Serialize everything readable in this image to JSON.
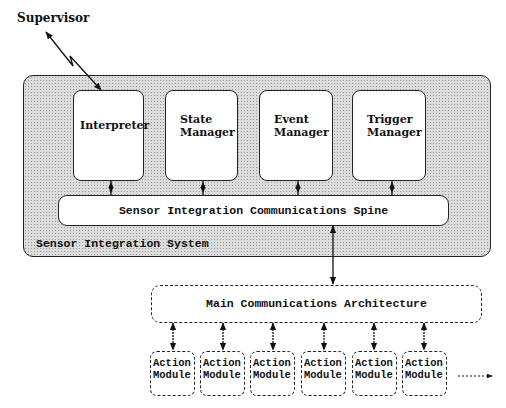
{
  "diagram": {
    "supervisor": {
      "label": "Supervisor"
    },
    "system": {
      "label": "Sensor Integration System",
      "components": [
        {
          "line1": "Interpreter",
          "line2": ""
        },
        {
          "line1": "State",
          "line2": "Manager"
        },
        {
          "line1": "Event",
          "line2": "Manager"
        },
        {
          "line1": "Trigger",
          "line2": "Manager"
        }
      ],
      "spine": {
        "label": "Sensor Integration Communications Spine"
      }
    },
    "main_architecture": {
      "label": "Main Communications Architecture"
    },
    "action_modules": [
      {
        "line1": "Action",
        "line2": "Module"
      },
      {
        "line1": "Action",
        "line2": "Module"
      },
      {
        "line1": "Action",
        "line2": "Module"
      },
      {
        "line1": "Action",
        "line2": "Module"
      },
      {
        "line1": "Action",
        "line2": "Module"
      },
      {
        "line1": "Action",
        "line2": "Module"
      }
    ],
    "connections": [
      {
        "from": "Supervisor",
        "to": "Interpreter",
        "style": "zigzag-bidirectional"
      },
      {
        "from": "Interpreter",
        "to": "Sensor Integration Communications Spine",
        "style": "bidirectional"
      },
      {
        "from": "State Manager",
        "to": "Sensor Integration Communications Spine",
        "style": "bidirectional"
      },
      {
        "from": "Event Manager",
        "to": "Sensor Integration Communications Spine",
        "style": "bidirectional"
      },
      {
        "from": "Trigger Manager",
        "to": "Sensor Integration Communications Spine",
        "style": "bidirectional"
      },
      {
        "from": "Sensor Integration Communications Spine",
        "to": "Main Communications Architecture",
        "style": "bidirectional"
      },
      {
        "from": "Main Communications Architecture",
        "to": "Action Module (x6)",
        "style": "bidirectional-dashed"
      },
      {
        "from": "Action Modules",
        "to": "more (continuation)",
        "style": "dotted-arrow"
      }
    ]
  }
}
